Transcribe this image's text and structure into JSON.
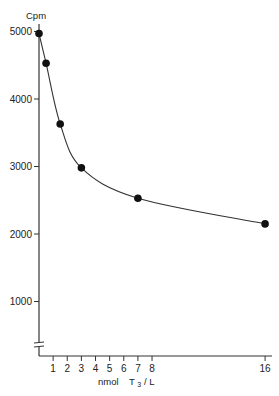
{
  "chart_data": {
    "type": "line",
    "title": "",
    "xlabel": "nmol T3 / L",
    "xlabel_parts": {
      "prefix": "nmol",
      "var": "T",
      "sub": "3",
      "suffix": " / L"
    },
    "ylabel": "Cpm",
    "x_ticks": [
      1,
      2,
      3,
      4,
      5,
      6,
      7,
      8,
      16
    ],
    "y_ticks": [
      1000,
      2000,
      3000,
      4000,
      5000
    ],
    "x_tick_labels": [
      "1",
      "2",
      "3",
      "4",
      "5",
      "6",
      "7",
      "8",
      "16"
    ],
    "y_tick_labels": [
      "1000",
      "2000",
      "3000",
      "4000",
      "5000"
    ],
    "xlim": [
      0,
      16
    ],
    "ylim": [
      0,
      5000
    ],
    "y_axis_break": true,
    "grid": false,
    "legend": null,
    "series": [
      {
        "name": "Standard curve",
        "markers": "filled-circle",
        "smooth_fit": true,
        "x": [
          0,
          0.5,
          1.5,
          3,
          7,
          16
        ],
        "y": [
          4970,
          4530,
          3630,
          2980,
          2530,
          2150
        ]
      }
    ]
  }
}
